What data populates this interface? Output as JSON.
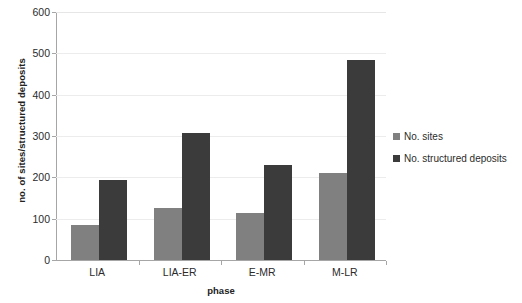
{
  "chart_data": {
    "type": "bar",
    "title": "",
    "subtitle": "",
    "xlabel": "phase",
    "ylabel": "no. of sites/structured deposits",
    "categories": [
      "LIA",
      "LIA-ER",
      "E-MR",
      "M-LR"
    ],
    "series": [
      {
        "name": "No. sites",
        "values": [
          84,
          127,
          114,
          211
        ],
        "color": "#808080"
      },
      {
        "name": "No. structured deposits",
        "values": [
          193,
          307,
          231,
          483
        ],
        "color": "#3b3b3b"
      }
    ],
    "ylim": [
      0,
      600
    ],
    "ytick_interval": 100,
    "yticks": [
      0,
      100,
      200,
      300,
      400,
      500,
      600
    ],
    "ytick_labels": [
      "0",
      "100",
      "200",
      "300",
      "400",
      "500",
      "600"
    ],
    "grid": "horizontal",
    "legend_position": "right",
    "axis_color": "#a6a6a6",
    "gridline_color": "#ececed",
    "background": "#ffffff"
  }
}
